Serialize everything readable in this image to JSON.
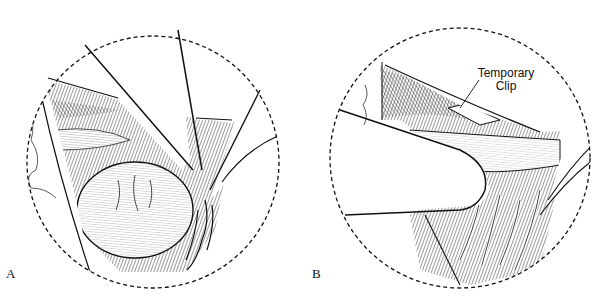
{
  "figure": {
    "panels": [
      {
        "id": "A",
        "label": "A"
      },
      {
        "id": "B",
        "label": "B",
        "annotations": [
          {
            "line1": "Temporary",
            "line2": "Clip"
          }
        ]
      }
    ],
    "colors": {
      "ink": "#111111",
      "background": "#ffffff"
    }
  }
}
